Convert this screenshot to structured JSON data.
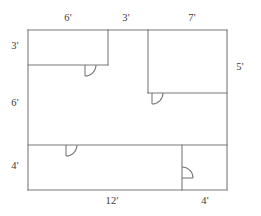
{
  "diagram": {
    "kind": "floor-plan",
    "stroke_color": "#7a7a7a",
    "label_color": "#3a3a3a",
    "background_color": "#ffffff",
    "stroke_width": 1.1,
    "dimension_labels": [
      {
        "id": "top-left-width",
        "text": "6'",
        "x": 68,
        "y": 19,
        "edge": "top",
        "position": "top-left"
      },
      {
        "id": "top-middle-gap",
        "text": "3'",
        "x": 126,
        "y": 19,
        "edge": "top",
        "position": "top-middle"
      },
      {
        "id": "top-right-width",
        "text": "7'",
        "x": 192,
        "y": 19,
        "edge": "top",
        "position": "top-right"
      },
      {
        "id": "left-upper-height",
        "text": "3'",
        "x": 15,
        "y": 47,
        "edge": "left",
        "position": "upper-left"
      },
      {
        "id": "left-middle-height",
        "text": "6'",
        "x": 15,
        "y": 104,
        "edge": "left",
        "position": "middle-left"
      },
      {
        "id": "left-lower-height",
        "text": "4'",
        "x": 15,
        "y": 167,
        "edge": "left",
        "position": "lower-left"
      },
      {
        "id": "right-upper-height",
        "text": "5'",
        "x": 240,
        "y": 68,
        "edge": "right",
        "position": "upper-right"
      },
      {
        "id": "bottom-left-width",
        "text": "12'",
        "x": 112,
        "y": 202,
        "edge": "bottom",
        "position": "bottom-left"
      },
      {
        "id": "bottom-right-width",
        "text": "4'",
        "x": 205,
        "y": 202,
        "edge": "bottom",
        "position": "bottom-right"
      }
    ],
    "walls": [
      {
        "id": "outer-left",
        "x1": 28,
        "y1": 30,
        "x2": 28,
        "y2": 190
      },
      {
        "id": "outer-bottom",
        "x1": 28,
        "y1": 190,
        "x2": 227,
        "y2": 190
      },
      {
        "id": "outer-right",
        "x1": 227,
        "y1": 30,
        "x2": 227,
        "y2": 190
      },
      {
        "id": "top-left-room-top",
        "x1": 28,
        "y1": 30,
        "x2": 108,
        "y2": 30
      },
      {
        "id": "top-left-room-right",
        "x1": 108,
        "y1": 30,
        "x2": 108,
        "y2": 65
      },
      {
        "id": "top-left-room-bottom",
        "x1": 28,
        "y1": 65,
        "x2": 108,
        "y2": 65
      },
      {
        "id": "top-gap-span",
        "x1": 108,
        "y1": 30,
        "x2": 148,
        "y2": 30
      },
      {
        "id": "top-right-room-top",
        "x1": 148,
        "y1": 30,
        "x2": 227,
        "y2": 30
      },
      {
        "id": "top-right-room-left",
        "x1": 148,
        "y1": 30,
        "x2": 148,
        "y2": 93
      },
      {
        "id": "top-right-room-bottom",
        "x1": 148,
        "y1": 93,
        "x2": 227,
        "y2": 93
      },
      {
        "id": "lower-band-divider-top",
        "x1": 28,
        "y1": 145,
        "x2": 227,
        "y2": 145
      },
      {
        "id": "bottom-right-room-left",
        "x1": 182,
        "y1": 145,
        "x2": 182,
        "y2": 190
      }
    ],
    "doors": [
      {
        "id": "door-top-left-room",
        "hinge_x": 85,
        "hinge_y": 65,
        "radius": 11,
        "swing": "down-right",
        "wall": "horizontal"
      },
      {
        "id": "door-top-right-room",
        "hinge_x": 152,
        "hinge_y": 93,
        "radius": 11,
        "swing": "down-right",
        "wall": "horizontal"
      },
      {
        "id": "door-bottom-left-room",
        "hinge_x": 66,
        "hinge_y": 145,
        "radius": 11,
        "swing": "down-right",
        "wall": "horizontal"
      },
      {
        "id": "door-bottom-right-room",
        "hinge_x": 182,
        "hinge_y": 178,
        "radius": 11,
        "swing": "up-right",
        "wall": "vertical"
      }
    ]
  }
}
